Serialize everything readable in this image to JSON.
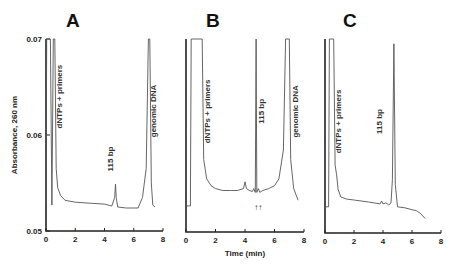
{
  "chart_data": {
    "type": "line",
    "ylabel": "Absorbance, 260 nm",
    "xlabel": "Time (min)",
    "ylim": [
      0.05,
      0.07
    ],
    "xlim": [
      0,
      8
    ],
    "yticks": [
      "0.05",
      "0.06",
      "0.07"
    ],
    "xticks": [
      "0",
      "2",
      "4",
      "6",
      "8"
    ],
    "grid": false,
    "panels": [
      {
        "label": "A",
        "annotations": [
          {
            "text": "dNTPs + primers",
            "x": 1.1,
            "y": 0.064
          },
          {
            "text": "115 bp",
            "x": 4.6,
            "y": 0.0575
          },
          {
            "text": "genomic DNA",
            "x": 7.5,
            "y": 0.0625
          }
        ],
        "x": [
          0,
          0.05,
          0.1,
          0.3,
          0.4,
          0.5,
          0.6,
          0.7,
          0.8,
          1.0,
          1.3,
          2,
          3,
          4,
          4.5,
          4.7,
          4.75,
          4.8,
          4.9,
          5.5,
          6.3,
          6.6,
          6.85,
          7.0,
          7.1,
          7.2,
          7.3,
          7.45
        ],
        "y": [
          0.0527,
          0.07,
          0.07,
          0.07,
          0.0527,
          0.07,
          0.07,
          0.0565,
          0.0545,
          0.0537,
          0.0532,
          0.053,
          0.0529,
          0.0528,
          0.0526,
          0.0535,
          0.0549,
          0.0535,
          0.0525,
          0.0524,
          0.0524,
          0.0535,
          0.0565,
          0.07,
          0.07,
          0.055,
          0.0527,
          0.0525
        ]
      },
      {
        "label": "B",
        "annotations": [
          {
            "text": "dNTPs + primers",
            "x": 1.6,
            "y": 0.0625
          },
          {
            "text": "115 bp",
            "x": 5.3,
            "y": 0.0625
          },
          {
            "text": "genomic DNA",
            "x": 7.6,
            "y": 0.0625
          },
          {
            "text": "↑↑",
            "x": 4.9,
            "y": 0.0533
          }
        ],
        "x": [
          0,
          0.3,
          0.35,
          1.1,
          1.2,
          1.4,
          1.7,
          2,
          2.5,
          3,
          3.5,
          3.9,
          4.0,
          4.1,
          4.3,
          4.5,
          4.6,
          4.7,
          4.75,
          4.8,
          4.9,
          5.0,
          5.2,
          5.6,
          6.0,
          6.3,
          6.6,
          6.75,
          7.0,
          7.1,
          7.3,
          7.6
        ],
        "y": [
          0.0527,
          0.0527,
          0.07,
          0.07,
          0.0575,
          0.0555,
          0.0548,
          0.0545,
          0.0543,
          0.0543,
          0.0543,
          0.0545,
          0.0552,
          0.0545,
          0.0543,
          0.0542,
          0.0545,
          0.0541,
          0.07,
          0.0541,
          0.0545,
          0.0541,
          0.0543,
          0.0545,
          0.0548,
          0.0555,
          0.0585,
          0.07,
          0.07,
          0.0575,
          0.0545,
          0.0533
        ]
      },
      {
        "label": "C",
        "annotations": [
          {
            "text": "dNTPs + primers",
            "x": 1.1,
            "y": 0.0615
          },
          {
            "text": "115 bp",
            "x": 3.9,
            "y": 0.0615
          }
        ],
        "x": [
          0,
          0.25,
          0.3,
          0.6,
          0.7,
          0.8,
          0.9,
          1.1,
          1.5,
          2,
          3,
          3.8,
          3.9,
          4.0,
          4.2,
          4.4,
          4.55,
          4.65,
          4.75,
          4.85,
          5.0,
          5.5,
          6.0,
          6.3,
          6.6,
          6.9
        ],
        "y": [
          0.0527,
          0.0527,
          0.07,
          0.07,
          0.057,
          0.056,
          0.0545,
          0.0537,
          0.0535,
          0.0534,
          0.0532,
          0.053,
          0.0533,
          0.053,
          0.0531,
          0.0529,
          0.0531,
          0.0555,
          0.0695,
          0.055,
          0.0527,
          0.0526,
          0.0524,
          0.0523,
          0.052,
          0.0515
        ]
      }
    ]
  }
}
